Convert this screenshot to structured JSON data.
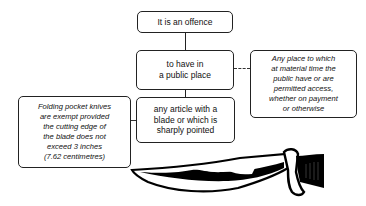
{
  "diagram": {
    "nodes": {
      "offence": {
        "label": "It is an offence"
      },
      "public_place": {
        "lines": [
          "to have in",
          "a public place"
        ]
      },
      "article": {
        "lines": [
          "any article with a",
          "blade or which is",
          "sharply pointed"
        ]
      },
      "public_place_note": {
        "lines": [
          "Any place to which",
          "at material time the",
          "public have or are",
          "permitted access,",
          "whether on payment",
          "or otherwise"
        ]
      },
      "folding_knife_note": {
        "lines": [
          "Folding pocket knives",
          "are exempt provided",
          "the cutting edge of",
          "the blade does not",
          "exceed 3 inches",
          "(7.62 centimetres)"
        ]
      }
    },
    "edges": [
      {
        "from": "offence",
        "to": "public_place",
        "style": "solid"
      },
      {
        "from": "public_place",
        "to": "article",
        "style": "solid"
      },
      {
        "from": "public_place",
        "to": "public_place_note",
        "style": "dashed"
      },
      {
        "from": "article",
        "to": "folding_knife_note",
        "style": "dashed"
      }
    ],
    "illustration": {
      "icon": "knife-icon"
    }
  }
}
